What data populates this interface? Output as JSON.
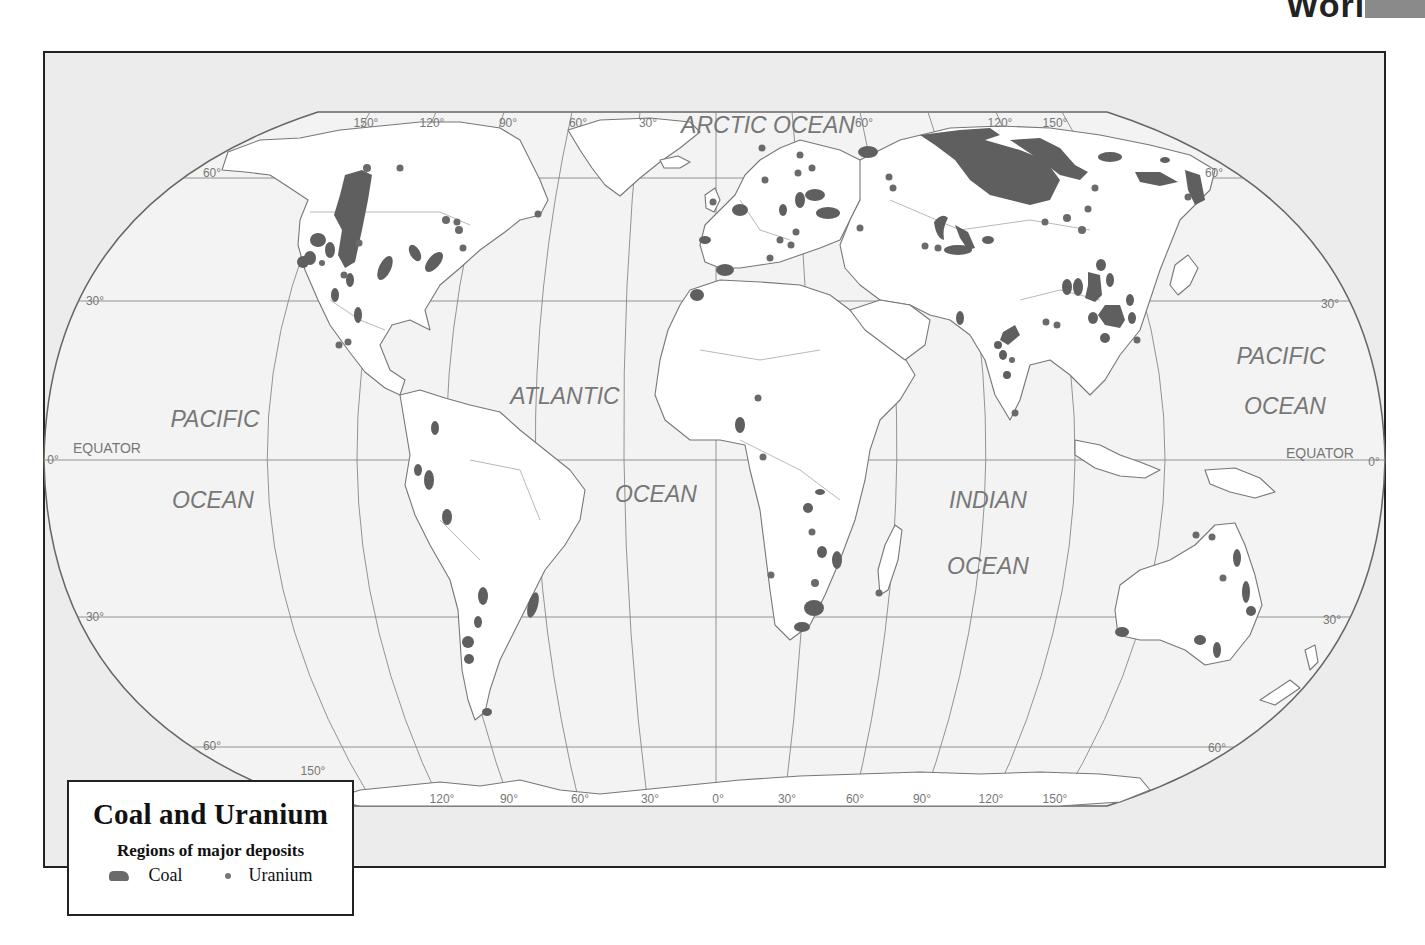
{
  "page": {
    "heading_fragment": "World",
    "tab_color": "#8a8a8a"
  },
  "legend": {
    "title": "Coal and Uranium",
    "subtitle": "Regions of major deposits",
    "items": [
      {
        "label": "Coal",
        "symbol": "coal-shape",
        "color": "#666666"
      },
      {
        "label": "Uranium",
        "symbol": "dot",
        "color": "#777777"
      }
    ]
  },
  "map": {
    "projection": "Robinson",
    "colors": {
      "ocean": "#f0f0f0",
      "land": "#ffffff",
      "border": "#777777",
      "deposit": "#5f5f5f",
      "frame_bg": "#ececec"
    },
    "ocean_labels": [
      {
        "text": "ARCTIC OCEAN",
        "x": 768,
        "y": 133
      },
      {
        "text": "PACIFIC",
        "x": 215,
        "y": 427
      },
      {
        "text": "OCEAN",
        "x": 213,
        "y": 508
      },
      {
        "text": "ATLANTIC",
        "x": 565,
        "y": 404
      },
      {
        "text": "OCEAN",
        "x": 656,
        "y": 502
      },
      {
        "text": "INDIAN",
        "x": 988,
        "y": 508
      },
      {
        "text": "OCEAN",
        "x": 988,
        "y": 574
      },
      {
        "text": "PACIFIC",
        "x": 1281,
        "y": 364
      },
      {
        "text": "OCEAN",
        "x": 1285,
        "y": 414
      }
    ],
    "equator_labels": [
      {
        "text": "EQUATOR",
        "x": 107,
        "y": 453
      },
      {
        "text": "EQUATOR",
        "x": 1320,
        "y": 458
      }
    ],
    "latitude_labels": [
      {
        "text": "60°",
        "x": 212,
        "y": 177
      },
      {
        "text": "30°",
        "x": 95,
        "y": 305
      },
      {
        "text": "0°",
        "x": 53,
        "y": 464
      },
      {
        "text": "30°",
        "x": 95,
        "y": 621
      },
      {
        "text": "60°",
        "x": 212,
        "y": 750
      },
      {
        "text": "60°",
        "x": 1214,
        "y": 177
      },
      {
        "text": "30°",
        "x": 1330,
        "y": 308
      },
      {
        "text": "0°",
        "x": 1374,
        "y": 466
      },
      {
        "text": "30°",
        "x": 1332,
        "y": 624
      },
      {
        "text": "60°",
        "x": 1217,
        "y": 752
      }
    ],
    "longitude_labels_top": [
      {
        "text": "150°",
        "x": 366,
        "y": 127
      },
      {
        "text": "120°",
        "x": 432,
        "y": 127
      },
      {
        "text": "90°",
        "x": 508,
        "y": 127
      },
      {
        "text": "60°",
        "x": 578,
        "y": 127
      },
      {
        "text": "30°",
        "x": 648,
        "y": 127
      },
      {
        "text": "60°",
        "x": 864,
        "y": 127
      },
      {
        "text": "120°",
        "x": 1000,
        "y": 127
      },
      {
        "text": "150°",
        "x": 1055,
        "y": 127
      }
    ],
    "longitude_labels_bottom": [
      {
        "text": "150°",
        "x": 313,
        "y": 775
      },
      {
        "text": "120°",
        "x": 442,
        "y": 803
      },
      {
        "text": "90°",
        "x": 509,
        "y": 803
      },
      {
        "text": "60°",
        "x": 580,
        "y": 803
      },
      {
        "text": "30°",
        "x": 650,
        "y": 803
      },
      {
        "text": "0°",
        "x": 718,
        "y": 803
      },
      {
        "text": "30°",
        "x": 787,
        "y": 803
      },
      {
        "text": "60°",
        "x": 855,
        "y": 803
      },
      {
        "text": "90°",
        "x": 922,
        "y": 803
      },
      {
        "text": "120°",
        "x": 991,
        "y": 803
      },
      {
        "text": "150°",
        "x": 1055,
        "y": 803
      }
    ]
  }
}
